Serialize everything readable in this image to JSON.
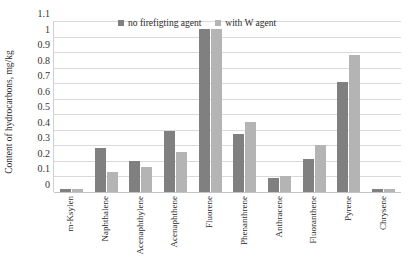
{
  "chart_data": {
    "type": "bar",
    "title": "",
    "xlabel": "",
    "ylabel": "Content of hydrocarbons, mg/kg",
    "ylim": [
      0,
      1.1
    ],
    "ytick_labels": [
      "1.1",
      "1",
      "0.9",
      "0.8",
      "0.7",
      "0.6",
      "0.5",
      "0.4",
      "0.3",
      "0.2",
      "0.1",
      "0"
    ],
    "ytick_values": [
      1.1,
      1.0,
      0.9,
      0.8,
      0.7,
      0.6,
      0.5,
      0.4,
      0.3,
      0.2,
      0.1,
      0
    ],
    "grid": true,
    "legend_position": "top-center",
    "categories": [
      "m-Ksylen",
      "Naphthalene",
      "Acenaphthylene",
      "Acenaphthene",
      "Fluorene",
      "Phenanthrene",
      "Anthracene",
      "Fluoranthene",
      "Pyrene",
      "Chrysene"
    ],
    "series": [
      {
        "name": "no firefigting agent",
        "color": "#808080",
        "values": [
          0.02,
          0.28,
          0.2,
          0.39,
          1.05,
          0.37,
          0.09,
          0.21,
          0.71,
          0.02
        ]
      },
      {
        "name": "with W agent",
        "color": "#b4b4b4",
        "values": [
          0.02,
          0.13,
          0.16,
          0.26,
          1.05,
          0.45,
          0.1,
          0.3,
          0.88,
          0.02
        ]
      }
    ]
  }
}
